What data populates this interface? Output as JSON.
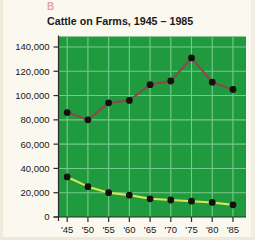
{
  "panel": {
    "letter": "B"
  },
  "chart_data": {
    "type": "line",
    "title": "Cattle on Farms, 1945 – 1985",
    "xlabel": "",
    "ylabel": "",
    "x": [
      1945,
      1950,
      1955,
      1960,
      1965,
      1970,
      1975,
      1980,
      1985
    ],
    "categories": [
      "'45",
      "'50",
      "'55",
      "'60",
      "'65",
      "'70",
      "'75",
      "'80",
      "'85"
    ],
    "xtick_labels": [
      "'45",
      "'50",
      "'55",
      "'60",
      "'65",
      "'70",
      "'75",
      "'80",
      "'85"
    ],
    "ytick_labels": [
      "0",
      "20,000",
      "40,000",
      "60,000",
      "80,000",
      "100,000",
      "120,000",
      "140,000"
    ],
    "ytick_values": [
      0,
      20000,
      40000,
      60000,
      80000,
      100000,
      120000,
      140000
    ],
    "ylim": [
      0,
      140000
    ],
    "grid": true,
    "legend": "none",
    "series": [
      {
        "name": "upper-series",
        "color": "#8a4a4a",
        "marker_color": "#16110f",
        "values": [
          86000,
          80000,
          94000,
          96000,
          109000,
          112000,
          131000,
          111000,
          105000
        ]
      },
      {
        "name": "lower-series",
        "color": "#d6e84f",
        "marker_color": "#16110f",
        "values": [
          33000,
          25000,
          20000,
          18000,
          15000,
          14000,
          13000,
          12000,
          10000
        ]
      }
    ],
    "colors": {
      "plot_background": "#1f9a3f",
      "gridline": "#79c98d",
      "axis": "#2b2b2b",
      "page_background": "#fbf8f0",
      "title": "#1a1a18",
      "panel_letter": "#e8a0a8"
    }
  }
}
